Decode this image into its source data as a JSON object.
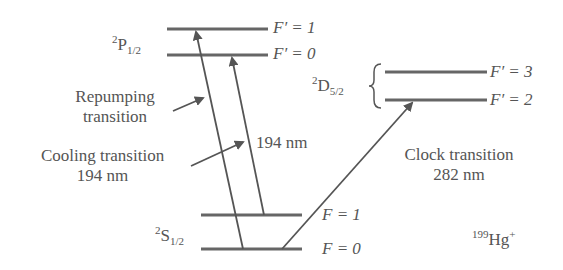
{
  "diagram": {
    "ion_label": {
      "mass": "199",
      "element": "Hg",
      "charge": "+"
    },
    "states": {
      "p": {
        "mult": "2",
        "letter": "P",
        "j": "1/2"
      },
      "s": {
        "mult": "2",
        "letter": "S",
        "j": "1/2"
      },
      "d": {
        "mult": "2",
        "letter": "D",
        "j": "5/2"
      }
    },
    "levels": {
      "p_f1": "F′ = 1",
      "p_f0": "F′ = 0",
      "d_f3": "F′ = 3",
      "d_f2": "F′ = 2",
      "s_f1": "F = 1",
      "s_f0": "F = 0"
    },
    "annotations": {
      "repump_line1": "Repumping",
      "repump_line2": "transition",
      "cool_line1": "Cooling transition",
      "cool_line2": "194 nm",
      "mid_wavelength": "194 nm",
      "clock_line1": "Clock transition",
      "clock_line2": "282 nm"
    },
    "colors": {
      "line": "#555555",
      "text": "#555555"
    }
  }
}
